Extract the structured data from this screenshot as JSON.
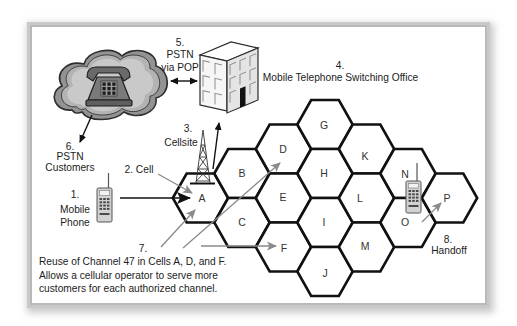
{
  "labels": {
    "pstn_pop": {
      "num": "5.",
      "line1": "PSTN",
      "line2": "via POP"
    },
    "mtso": {
      "num": "4.",
      "text": "Mobile Telephone Switching Office"
    },
    "cellsite": {
      "num": "3.",
      "text": "Cellsite"
    },
    "pstn_customers": {
      "num": "6.",
      "line1": "PSTN",
      "line2": "Customers"
    },
    "cell": {
      "text": "2. Cell"
    },
    "mobile_phone": {
      "num": "1.",
      "line1": "Mobile",
      "line2": "Phone"
    },
    "reuse": {
      "num": "7.",
      "lines": [
        "Reuse of Channel 47 in Cells A, D, and F.",
        "Allows a cellular operator to serve more",
        "customers for each authorized channel."
      ]
    },
    "handoff": {
      "num": "8.",
      "text": "Handoff"
    }
  },
  "cells": [
    "A",
    "B",
    "C",
    "D",
    "E",
    "F",
    "G",
    "H",
    "I",
    "J",
    "K",
    "L",
    "M",
    "N",
    "O",
    "P"
  ],
  "icons": {
    "cloud": "pstn-cloud-icon",
    "telephone": "desk-telephone-icon",
    "building": "switching-office-building-icon",
    "tower": "cell-tower-icon",
    "mobile_phone": "mobile-phone-icon"
  },
  "colors": {
    "hex_stroke": "#111111",
    "arrow_black": "#111111",
    "arrow_gray": "#8a8a8a",
    "text": "#1c1c1c",
    "frame": "#bdbdbd"
  }
}
